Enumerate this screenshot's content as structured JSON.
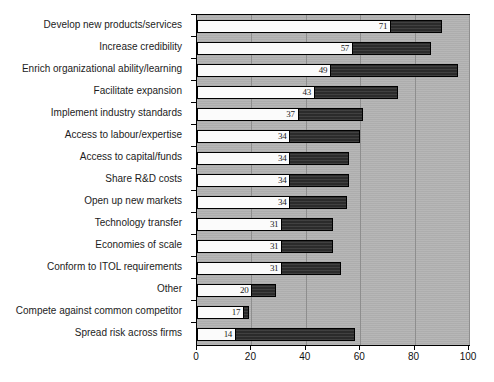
{
  "chart_data": {
    "type": "bar",
    "orientation": "horizontal",
    "stacked": true,
    "title": "",
    "subtitle": "",
    "xlabel": "",
    "ylabel": "",
    "xlim": [
      0,
      100
    ],
    "ylim": null,
    "grid": true,
    "grid_axis": "x",
    "legend": null,
    "legend_position": "none",
    "plot_background": "#b3b3b3",
    "tick_labels_x": [
      "0",
      "20",
      "40",
      "60",
      "80",
      "100"
    ],
    "tick_values_x": [
      0,
      20,
      40,
      60,
      80,
      100
    ],
    "categories": [
      "Develop new products/services",
      "Increase credibility",
      "Enrich organizational ability/learning",
      "Facilitate expansion",
      "Implement industry standards",
      "Access to labour/expertise",
      "Access to capital/funds",
      "Share R&D costs",
      "Open up new markets",
      "Technology transfer",
      "Economies of scale",
      "Conform to ITOL requirements",
      "Other",
      "Compete against common competitor",
      "Spread risk across firms"
    ],
    "series": [
      {
        "name": "series-1-light",
        "color": "#fbfbfb",
        "labelled": true,
        "values": [
          71,
          57,
          49,
          43,
          37,
          34,
          34,
          34,
          34,
          31,
          31,
          31,
          20,
          17,
          14
        ]
      },
      {
        "name": "series-2-dark",
        "color": "#2b2b2b",
        "labelled": false,
        "values": [
          19,
          29,
          47,
          31,
          24,
          26,
          22,
          22,
          21,
          19,
          19,
          22,
          9,
          2,
          44
        ]
      }
    ],
    "totals": [
      90,
      86,
      96,
      74,
      61,
      60,
      56,
      56,
      55,
      50,
      50,
      53,
      29,
      19,
      58
    ],
    "data_labels": [
      "71",
      "57",
      "49",
      "43",
      "37",
      "34",
      "34",
      "34",
      "34",
      "31",
      "31",
      "31",
      "20",
      "17",
      "14"
    ]
  }
}
